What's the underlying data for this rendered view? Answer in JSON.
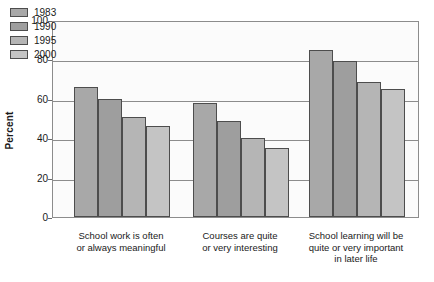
{
  "chart_data": {
    "type": "bar",
    "title": "",
    "xlabel": "",
    "ylabel": "Percent",
    "ylim": [
      0,
      100
    ],
    "yticks": [
      0,
      20,
      40,
      60,
      80,
      100
    ],
    "grid": true,
    "legend_position": "top-left",
    "categories": [
      "School work is often or always meaningful",
      "Courses are quite or very interesting",
      "School learning will be quite or very important in later life"
    ],
    "category_lines": [
      [
        "School work is often",
        "or always meaningful"
      ],
      [
        "Courses are quite",
        "or very interesting"
      ],
      [
        "School learning will be",
        "quite or very important",
        "in later life"
      ]
    ],
    "series": [
      {
        "name": "1983",
        "color": "#a8a8a8",
        "values": [
          66,
          58,
          85
        ]
      },
      {
        "name": "1990",
        "color": "#9e9e9e",
        "values": [
          60,
          48.5,
          79
        ]
      },
      {
        "name": "1995",
        "color": "#b5b5b5",
        "values": [
          51,
          40,
          68.5
        ]
      },
      {
        "name": "2000",
        "color": "#c4c4c4",
        "values": [
          46,
          35,
          65
        ]
      }
    ]
  },
  "axis": {
    "y_title": "Percent",
    "y_tick_labels": [
      "100",
      "80",
      "60",
      "40",
      "20",
      "0"
    ]
  },
  "legend": {
    "items": [
      {
        "label": "1983"
      },
      {
        "label": "1990"
      },
      {
        "label": "1995"
      },
      {
        "label": "2000"
      }
    ]
  },
  "colors": {
    "plot_background": "#fbfbfb",
    "axis_line": "#8c8c8c",
    "bar_border": "#4d4d4d",
    "text": "#1a1a1a"
  }
}
